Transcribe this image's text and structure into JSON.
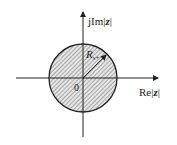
{
  "diagram": {
    "type": "z-plane region of convergence",
    "region": "interior of circle (hatched)",
    "labels": {
      "imag_axis_prefix": "jIm",
      "real_axis_prefix": "Re",
      "variable": "z",
      "origin": "0",
      "radius_symbol": "R",
      "radius_subscript": "x+"
    },
    "colors": {
      "stroke": "#222222",
      "hatch": "#555555",
      "fill": "#e6e6e6",
      "background": "#ffffff"
    }
  }
}
